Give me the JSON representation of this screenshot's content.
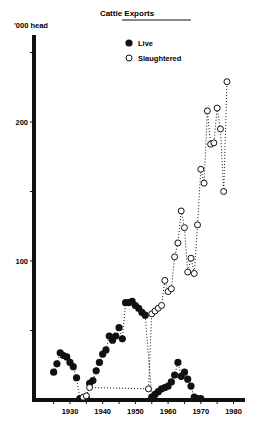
{
  "chart_data": {
    "type": "scatter",
    "title": "Cattle Exports",
    "xlabel": "",
    "ylabel": "'000 head",
    "xlim": [
      1922,
      1981
    ],
    "ylim": [
      0,
      255
    ],
    "x_ticks": [
      1930,
      1940,
      1950,
      1960,
      1970,
      1980
    ],
    "y_ticks": [
      50,
      100,
      150,
      200,
      250
    ],
    "y_tick_labels": {
      "100": "100",
      "200": "200"
    },
    "grid": false,
    "legend_position": "top-center",
    "connector": "dotted",
    "series": [
      {
        "name": "Live",
        "marker": "filled-circle",
        "points": [
          [
            1925,
            20
          ],
          [
            1926,
            26
          ],
          [
            1927,
            34
          ],
          [
            1928,
            32
          ],
          [
            1929,
            31
          ],
          [
            1930,
            27
          ],
          [
            1931,
            24
          ],
          [
            1932,
            16
          ],
          [
            1933,
            1
          ],
          [
            1934,
            1
          ],
          [
            1935,
            2
          ],
          [
            1936,
            12
          ],
          [
            1937,
            14
          ],
          [
            1938,
            21
          ],
          [
            1939,
            27
          ],
          [
            1940,
            33
          ],
          [
            1941,
            36
          ],
          [
            1942,
            46
          ],
          [
            1943,
            43
          ],
          [
            1944,
            46
          ],
          [
            1945,
            52
          ],
          [
            1946,
            44
          ],
          [
            1947,
            70
          ],
          [
            1948,
            70
          ],
          [
            1949,
            71
          ],
          [
            1950,
            68
          ],
          [
            1951,
            66
          ],
          [
            1952,
            63
          ],
          [
            1953,
            61
          ],
          [
            1955,
            2
          ],
          [
            1956,
            4
          ],
          [
            1957,
            6
          ],
          [
            1958,
            8
          ],
          [
            1959,
            9
          ],
          [
            1960,
            10
          ],
          [
            1961,
            13
          ],
          [
            1962,
            18
          ],
          [
            1963,
            27
          ],
          [
            1964,
            17
          ],
          [
            1965,
            20
          ],
          [
            1966,
            15
          ],
          [
            1967,
            10
          ],
          [
            1968,
            2
          ],
          [
            1969,
            1
          ],
          [
            1970,
            1
          ]
        ]
      },
      {
        "name": "Slaughtered",
        "marker": "open-circle",
        "points": [
          [
            1934,
            2
          ],
          [
            1935,
            3
          ],
          [
            1936,
            9
          ],
          [
            1954,
            8
          ],
          [
            1955,
            62
          ],
          [
            1956,
            64
          ],
          [
            1957,
            66
          ],
          [
            1958,
            68
          ],
          [
            1959,
            86
          ],
          [
            1960,
            78
          ],
          [
            1961,
            80
          ],
          [
            1962,
            103
          ],
          [
            1963,
            113
          ],
          [
            1964,
            136
          ],
          [
            1965,
            124
          ],
          [
            1966,
            92
          ],
          [
            1967,
            102
          ],
          [
            1968,
            91
          ],
          [
            1969,
            126
          ],
          [
            1970,
            166
          ],
          [
            1971,
            156
          ],
          [
            1972,
            208
          ],
          [
            1973,
            184
          ],
          [
            1974,
            185
          ],
          [
            1975,
            210
          ],
          [
            1976,
            195
          ],
          [
            1977,
            150
          ],
          [
            1978,
            229
          ]
        ]
      }
    ]
  }
}
